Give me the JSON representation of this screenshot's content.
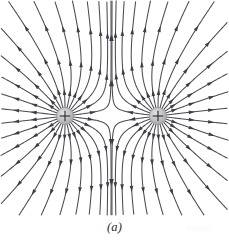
{
  "figure": {
    "caption": "(a)",
    "background_color": "#ffffff",
    "line_color": "#4a4a52",
    "arrow_color": "#3d3d45",
    "charge_fill_color": "#b9b9bd",
    "charge_edge_color": "#8d8d93",
    "charge_symbol_color": "#2e2e34"
  },
  "canvas": {
    "width": 229,
    "height": 246
  },
  "chart_data": {
    "type": "line",
    "xlabel": "",
    "ylabel": "",
    "xlim": [
      0,
      229
    ],
    "ylim": [
      0,
      246
    ],
    "grid": false,
    "legend": "none",
    "annotations": [
      "(a)"
    ],
    "charges": [
      {
        "name": "left-charge",
        "label": "+",
        "sign": 1,
        "magnitude": 1,
        "x": 65,
        "y": 116,
        "radius": 8.5
      },
      {
        "name": "right-charge",
        "label": "+",
        "sign": 1,
        "magnitude": 1,
        "x": 158,
        "y": 116,
        "radius": 8.5
      }
    ],
    "field_lines": {
      "lines_per_charge": 26,
      "start_angle_offset_deg": 6.9,
      "step_length": 1.15,
      "max_steps": 900,
      "direction": "outward",
      "arrows_per_line": 3,
      "arrow_fractions": [
        0.14,
        0.42,
        0.74
      ],
      "arrow_length": 6.2,
      "arrow_width": 3.6,
      "bounds": {
        "min_x": 2,
        "min_y": 2,
        "max_x": 227,
        "max_y": 214
      }
    }
  }
}
